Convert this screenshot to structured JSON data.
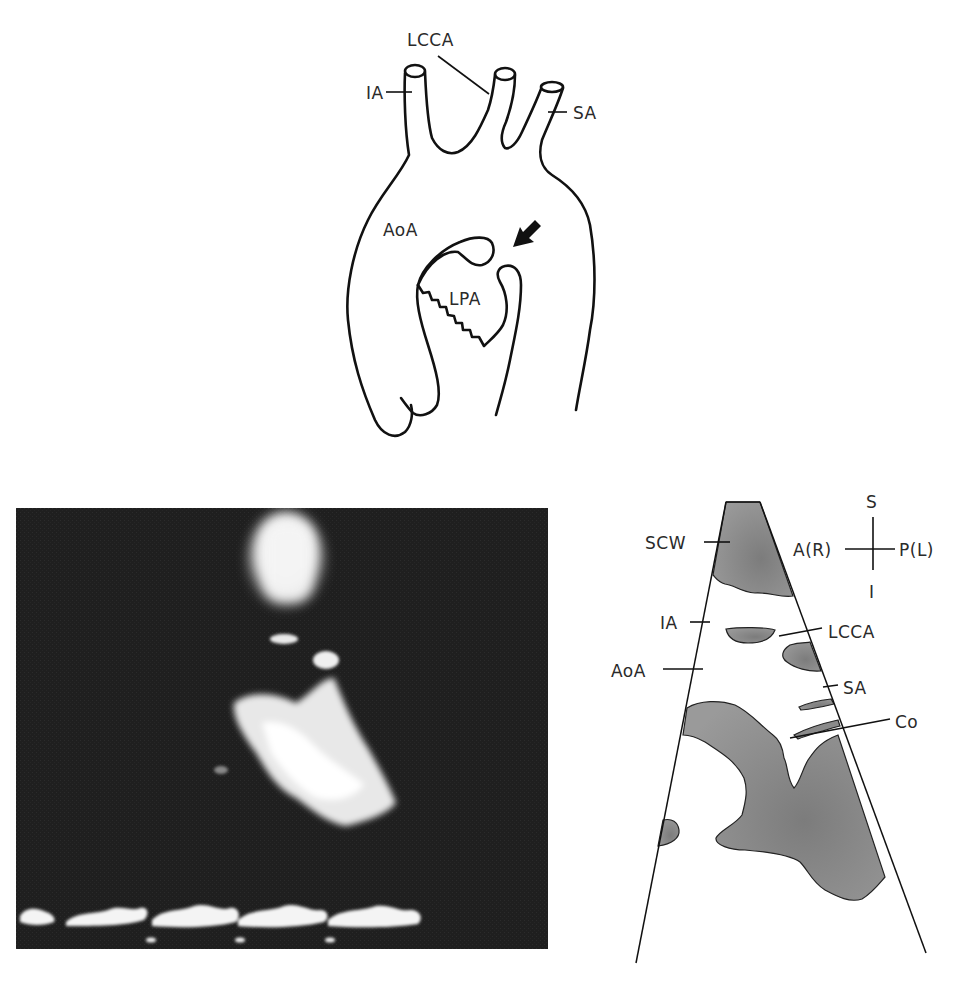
{
  "figure": {
    "top_diagram": {
      "title": "Aortic arch schematic",
      "labels": {
        "lcca": "LCCA",
        "ia": "IA",
        "sa": "SA",
        "aoa": "AoA",
        "lpa": "LPA"
      },
      "arrow": "arrow-pointing-down-left"
    },
    "echo_image": {
      "title": "Suprasternal echocardiogram"
    },
    "schematic": {
      "labels": {
        "scw": "SCW",
        "ia": "IA",
        "aoa": "AoA",
        "lcca": "LCCA",
        "sa": "SA",
        "co": "Co"
      },
      "orientation": {
        "superior": "S",
        "inferior": "I",
        "anterior": "A(R)",
        "posterior": "P(L)"
      }
    }
  },
  "colors": {
    "line": "#111111",
    "echo_bg": "#1e1e1e",
    "shade": "#8a8a8a"
  }
}
